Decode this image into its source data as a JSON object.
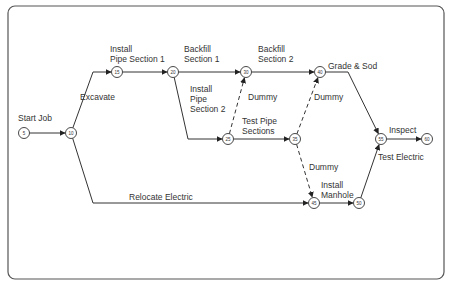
{
  "diagram": {
    "type": "activity-on-arrow network",
    "frame": {
      "x": 8,
      "y": 6,
      "w": 436,
      "h": 273,
      "radius": 7,
      "stroke": "#555555"
    },
    "colors": {
      "line": "#333333",
      "text": "#333333",
      "node_fill": "#ffffff"
    },
    "nodes": [
      {
        "id": "5",
        "label": "5",
        "x": 24,
        "y": 133
      },
      {
        "id": "10",
        "label": "10",
        "x": 71,
        "y": 133
      },
      {
        "id": "15",
        "label": "15",
        "x": 117,
        "y": 72
      },
      {
        "id": "20",
        "label": "20",
        "x": 173,
        "y": 72
      },
      {
        "id": "25",
        "label": "25",
        "x": 228,
        "y": 139
      },
      {
        "id": "30",
        "label": "30",
        "x": 246,
        "y": 72
      },
      {
        "id": "35",
        "label": "35",
        "x": 295,
        "y": 139
      },
      {
        "id": "40",
        "label": "40",
        "x": 320,
        "y": 72
      },
      {
        "id": "45",
        "label": "45",
        "x": 314,
        "y": 203
      },
      {
        "id": "50",
        "label": "50",
        "x": 359,
        "y": 203
      },
      {
        "id": "55",
        "label": "55",
        "x": 381,
        "y": 139
      },
      {
        "id": "60",
        "label": "60",
        "x": 427,
        "y": 139
      }
    ],
    "activities": [
      {
        "from": "5",
        "to": "10",
        "label": [
          "Start Job"
        ],
        "style": "solid",
        "label_x": 18,
        "label_y": 121
      },
      {
        "from": "10",
        "to": "15",
        "label": [
          "Excavate"
        ],
        "style": "solid",
        "label_x": 80,
        "label_y": 100
      },
      {
        "from": "15",
        "to": "20",
        "label": [
          "Install",
          "Pipe Section 1"
        ],
        "style": "solid",
        "label_x": 110,
        "label_y": 52
      },
      {
        "from": "20",
        "to": "30",
        "label": [
          "Backfill",
          "Section 1"
        ],
        "style": "solid",
        "label_x": 184,
        "label_y": 52
      },
      {
        "from": "20",
        "to": "25",
        "label": [
          "Install",
          "Pipe",
          "Section 2"
        ],
        "style": "solid",
        "label_x": 190,
        "label_y": 92
      },
      {
        "from": "25",
        "to": "30",
        "label": [
          "Dummy"
        ],
        "style": "dashed",
        "label_x": 248,
        "label_y": 100
      },
      {
        "from": "30",
        "to": "40",
        "label": [
          "Backfill",
          "Section 2"
        ],
        "style": "solid",
        "label_x": 258,
        "label_y": 52
      },
      {
        "from": "25",
        "to": "35",
        "label": [
          "Test Pipe",
          "Sections"
        ],
        "style": "solid",
        "label_x": 242,
        "label_y": 124
      },
      {
        "from": "35",
        "to": "40",
        "label": [
          "Dummy"
        ],
        "style": "dashed",
        "label_x": 314,
        "label_y": 100
      },
      {
        "from": "40",
        "to": "55",
        "label": [
          "Grade & Sod"
        ],
        "style": "solid",
        "label_x": 328,
        "label_y": 69
      },
      {
        "from": "10",
        "to": "45",
        "label": [
          "Relocate Electric"
        ],
        "style": "solid",
        "label_x": 129,
        "label_y": 200
      },
      {
        "from": "35",
        "to": "45",
        "label": [
          "Dummy"
        ],
        "style": "dashed",
        "label_x": 309,
        "label_y": 170
      },
      {
        "from": "45",
        "to": "50",
        "label": [
          "Install",
          "Manhole"
        ],
        "style": "solid",
        "label_x": 321,
        "label_y": 188
      },
      {
        "from": "50",
        "to": "55",
        "label": [
          "Test Electric"
        ],
        "style": "solid",
        "label_x": 378,
        "label_y": 160
      },
      {
        "from": "55",
        "to": "60",
        "label": [
          "Inspect"
        ],
        "style": "solid",
        "label_x": 389,
        "label_y": 133
      }
    ]
  }
}
